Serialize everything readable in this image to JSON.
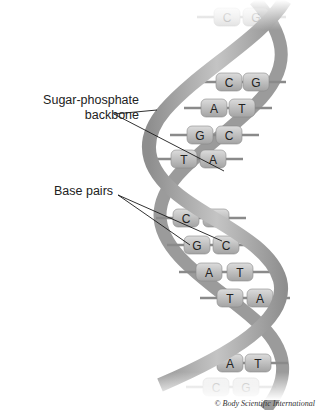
{
  "labels": {
    "backbone_line1": "Sugar-phosphate",
    "backbone_line2": "backbone",
    "base_pairs": "Base pairs"
  },
  "credit": "© Body Scientific International",
  "base_pairs": [
    {
      "left": "C",
      "right": "G",
      "y": 17,
      "lx": 227,
      "rx": 256,
      "faded": true
    },
    {
      "left": "C",
      "right": "G",
      "y": 82,
      "lx": 229,
      "rx": 256,
      "faded": false
    },
    {
      "left": "A",
      "right": "T",
      "y": 108,
      "lx": 214,
      "rx": 242,
      "faded": false
    },
    {
      "left": "G",
      "right": "C",
      "y": 135,
      "lx": 200,
      "rx": 229,
      "faded": false
    },
    {
      "left": "T",
      "right": "A",
      "y": 159,
      "lx": 184,
      "rx": 213,
      "faded": false
    },
    {
      "left": "C",
      "right": "G",
      "y": 218,
      "lx": 186,
      "rx": 216,
      "faded": false
    },
    {
      "left": "G",
      "right": "C",
      "y": 245,
      "lx": 197,
      "rx": 226,
      "faded": false
    },
    {
      "left": "A",
      "right": "T",
      "y": 272,
      "lx": 209,
      "rx": 240,
      "faded": false
    },
    {
      "left": "T",
      "right": "A",
      "y": 298,
      "lx": 230,
      "rx": 260,
      "faded": false
    },
    {
      "left": "A",
      "right": "T",
      "y": 363,
      "lx": 230,
      "rx": 258,
      "faded": false
    },
    {
      "left": "C",
      "right": "G",
      "y": 387,
      "lx": 216,
      "rx": 246,
      "faded": true
    }
  ],
  "colors": {
    "ribbon": "#a9a9a9",
    "ribbon_dark": "#8c8c8c",
    "base_light": "#c9c9c9",
    "base_dark": "#9a9a9a",
    "rung": "#8a8a8a",
    "leader": "#1a1a1a"
  }
}
